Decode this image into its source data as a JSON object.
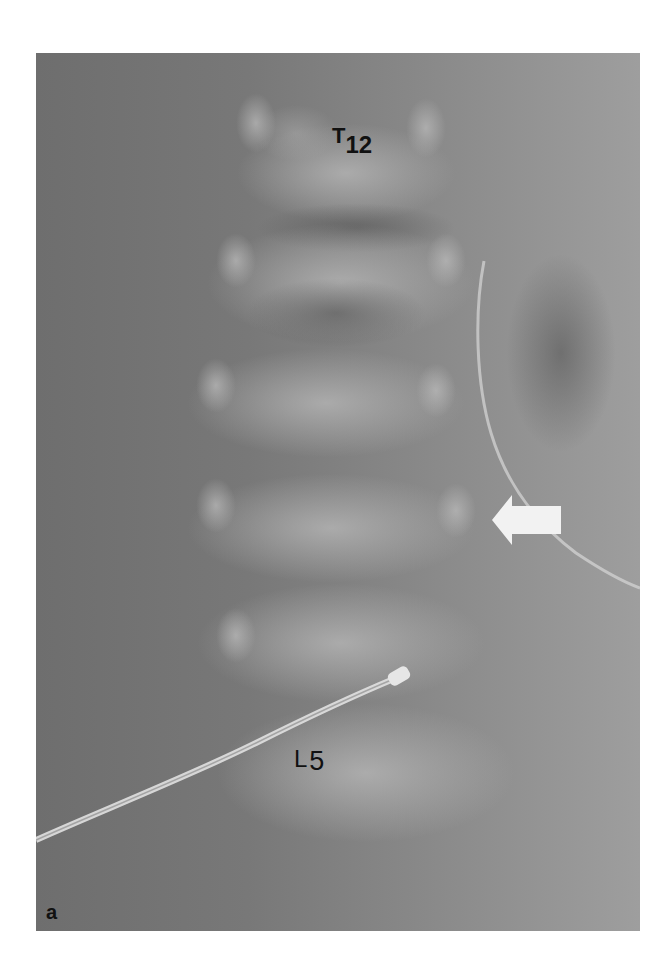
{
  "figure": {
    "panel_label": "a",
    "labels": {
      "top_vertebra": {
        "letter": "T",
        "number": "12"
      },
      "bottom_vertebra": {
        "letter": "L",
        "number": "5"
      }
    },
    "annotations": {
      "arrow": {
        "direction": "left",
        "color": "#f2f2f2"
      }
    },
    "colors": {
      "background": "#ffffff",
      "xray_dark": "#6e6e6e",
      "xray_light": "#9e9e9e",
      "label_text": "#111111"
    }
  }
}
